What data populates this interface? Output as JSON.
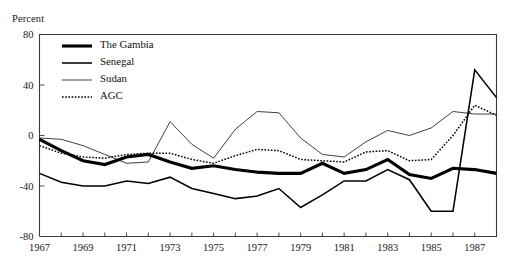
{
  "figure": {
    "title_clipped": "Figure 3. Real Exchange Rate Depreciation (percent), 1967-88",
    "ylabel": "Percent"
  },
  "chart_data": {
    "type": "line",
    "title": "",
    "xlabel": "",
    "ylabel": "Percent",
    "ylim": [
      -80,
      80
    ],
    "yticks": [
      80,
      40,
      0,
      -40,
      -80
    ],
    "ytick_labels": [
      "80",
      "40",
      "0",
      "-40",
      "-80"
    ],
    "xlim": [
      1967,
      1988
    ],
    "xticks": [
      1967,
      1968,
      1969,
      1970,
      1971,
      1972,
      1973,
      1974,
      1975,
      1976,
      1977,
      1978,
      1979,
      1980,
      1981,
      1982,
      1983,
      1984,
      1985,
      1986,
      1987,
      1988
    ],
    "xtick_labels_shown": [
      "1967",
      "1969",
      "1971",
      "1973",
      "1975",
      "1977",
      "1979",
      "1981",
      "1983",
      "1985",
      "1987"
    ],
    "grid": false,
    "legend_position": "top-left-inside",
    "x": [
      1967,
      1968,
      1969,
      1970,
      1971,
      1972,
      1973,
      1974,
      1975,
      1976,
      1977,
      1978,
      1979,
      1980,
      1981,
      1982,
      1983,
      1984,
      1985,
      1986,
      1987,
      1988
    ],
    "series": [
      {
        "name": "The Gambia",
        "style": "solid-thick",
        "values": [
          -3,
          -12,
          -20,
          -23,
          -17,
          -15,
          -21,
          -26,
          -24,
          -27,
          -29,
          -30,
          -30,
          -22,
          -30,
          -27,
          -19,
          -31,
          -34,
          -26,
          -27,
          -30
        ]
      },
      {
        "name": "Senegal",
        "style": "solid-medium",
        "values": [
          -30,
          -37,
          -40,
          -40,
          -36,
          -38,
          -33,
          -42,
          -46,
          -50,
          -48,
          -42,
          -57,
          -47,
          -36,
          -36,
          -27,
          -35,
          -60,
          -60,
          52,
          30
        ]
      },
      {
        "name": "Sudan",
        "style": "solid-thin",
        "values": [
          -2,
          -3,
          -8,
          -15,
          -22,
          -21,
          11,
          -7,
          -18,
          5,
          19,
          18,
          -2,
          -15,
          -17,
          -5,
          4,
          0,
          6,
          19,
          17,
          17
        ]
      },
      {
        "name": "AGC",
        "style": "dotted",
        "values": [
          -8,
          -14,
          -17,
          -18,
          -15,
          -14,
          -14,
          -19,
          -22,
          -16,
          -11,
          -12,
          -19,
          -20,
          -21,
          -13,
          -12,
          -20,
          -19,
          0,
          24,
          16
        ]
      }
    ]
  },
  "legend": {
    "items": [
      {
        "label": "The Gambia"
      },
      {
        "label": "Senegal"
      },
      {
        "label": "Sudan"
      },
      {
        "label": "AGC"
      }
    ]
  }
}
